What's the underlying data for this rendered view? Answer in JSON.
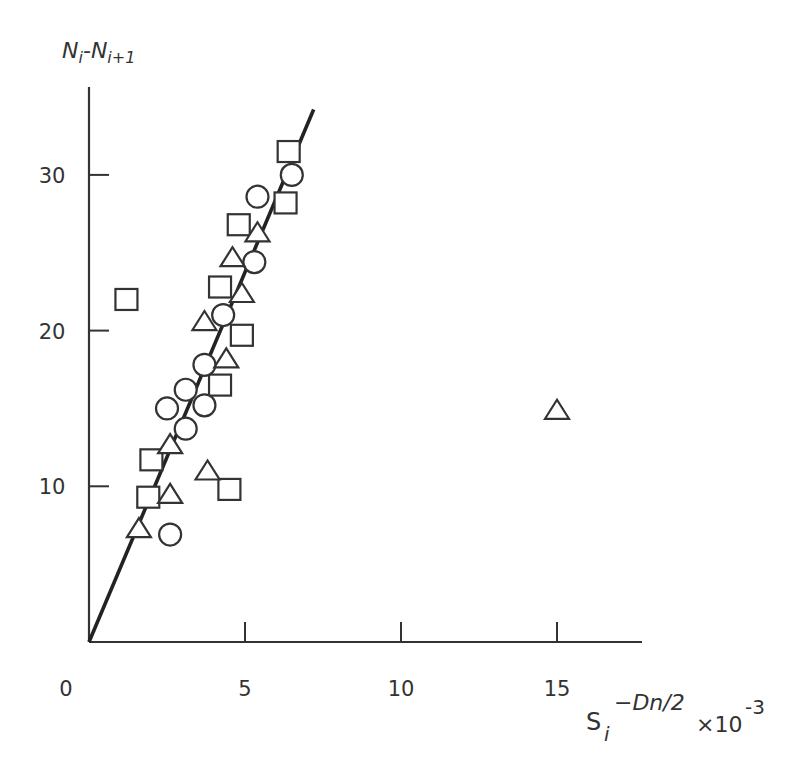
{
  "chart_data": {
    "type": "scatter",
    "title": "",
    "ylabel": "Ni-Ni+1",
    "ylabel_parts": {
      "base1": "N",
      "sub1": "i",
      "dash": "-",
      "base2": "N",
      "sub2": "i+1"
    },
    "xlabel": "S_i^(-Dn/2) ×10^-3",
    "xlabel_parts": {
      "base": "S",
      "sub": "i",
      "sup": "−Dn/2",
      "mult": "×10",
      "exp": "-3"
    },
    "xlim": [
      0,
      18
    ],
    "ylim": [
      0,
      35
    ],
    "xticks": [
      0,
      5,
      10,
      15
    ],
    "xtick_labels": [
      "0",
      "5",
      "10",
      "15"
    ],
    "yticks": [
      10,
      20,
      30
    ],
    "ytick_labels": [
      "10",
      "20",
      "30"
    ],
    "grid": false,
    "legend": null,
    "fit_line": {
      "x": [
        0,
        7.2
      ],
      "y": [
        0,
        34.2
      ],
      "description": "linear fit through origin"
    },
    "series": [
      {
        "name": "squares",
        "marker": "square",
        "points": [
          [
            1.2,
            22.0
          ],
          [
            2.0,
            11.7
          ],
          [
            1.9,
            9.3
          ],
          [
            4.5,
            9.8
          ],
          [
            4.2,
            16.5
          ],
          [
            4.9,
            19.7
          ],
          [
            4.2,
            22.8
          ],
          [
            4.8,
            26.8
          ],
          [
            6.3,
            28.2
          ],
          [
            6.4,
            31.5
          ]
        ]
      },
      {
        "name": "circles",
        "marker": "circle",
        "points": [
          [
            2.6,
            6.9
          ],
          [
            2.5,
            15.0
          ],
          [
            3.1,
            13.7
          ],
          [
            3.1,
            16.2
          ],
          [
            3.7,
            15.2
          ],
          [
            3.7,
            17.8
          ],
          [
            4.3,
            21.0
          ],
          [
            5.3,
            24.4
          ],
          [
            5.4,
            28.6
          ],
          [
            6.5,
            30.0
          ]
        ]
      },
      {
        "name": "triangles",
        "marker": "triangle",
        "points": [
          [
            1.6,
            7.2
          ],
          [
            2.6,
            9.4
          ],
          [
            2.6,
            12.6
          ],
          [
            3.8,
            10.9
          ],
          [
            3.7,
            20.5
          ],
          [
            4.4,
            18.1
          ],
          [
            4.9,
            22.3
          ],
          [
            4.6,
            24.6
          ],
          [
            5.4,
            26.2
          ],
          [
            15.0,
            14.8
          ]
        ]
      }
    ]
  },
  "colors": {
    "ink": "#333333",
    "background": "#ffffff"
  }
}
